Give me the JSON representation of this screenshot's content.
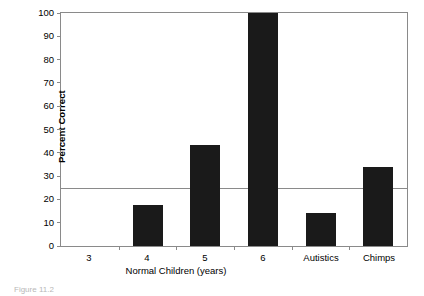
{
  "chart_data": {
    "type": "bar",
    "title": "",
    "xlabel": "Normal Children (years)",
    "ylabel": "Percent Correct",
    "categories": [
      "3",
      "4",
      "5",
      "6",
      "Autistics",
      "Chimps"
    ],
    "values": [
      0,
      17.5,
      43.5,
      100,
      14,
      34
    ],
    "ylim": [
      0,
      100
    ],
    "ytick_labels": [
      "100",
      "90",
      "80",
      "70",
      "60",
      "50",
      "40",
      "30",
      "20",
      "10",
      "0"
    ],
    "ytick_values": [
      100,
      90,
      80,
      70,
      60,
      50,
      40,
      30,
      20,
      10,
      0
    ],
    "grid": false,
    "legend": null,
    "annotations": [
      {
        "name": "chance-level-line",
        "type": "horizontal-line",
        "value": 25
      }
    ],
    "bar_color": "#1a1a1a",
    "axis_color": "#8a8a8a"
  },
  "caption": {
    "text": "Figure 11.2"
  }
}
